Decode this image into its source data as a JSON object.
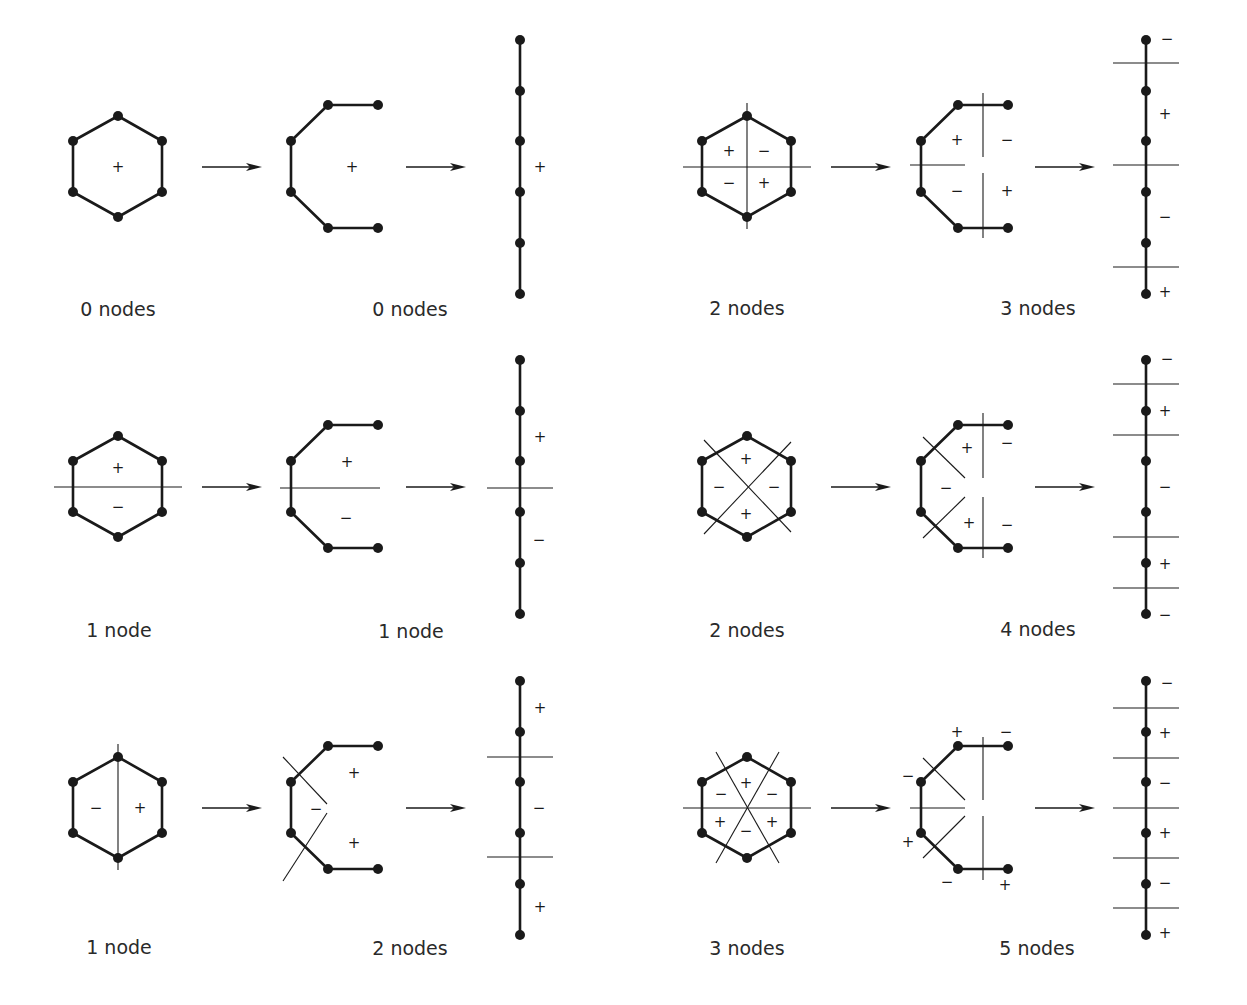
{
  "figure": {
    "colors": {
      "ink": "#1a1a1a",
      "background": "#ffffff"
    },
    "panels": [
      {
        "id": "r1-left",
        "col": 0,
        "row": 0,
        "hexagon": {
          "caption": "0 nodes",
          "node_lines": [],
          "signs": [
            {
              "s": "+",
              "dx": 0,
              "dy": 0
            }
          ]
        },
        "chain": {
          "node_lines": [],
          "signs": [
            {
              "s": "+",
              "x": 352,
              "y": 167
            }
          ]
        },
        "linear": {
          "caption": "0 nodes",
          "cuts": [],
          "signs": [
            {
              "s": "+",
              "x": 540,
              "y": 167
            }
          ]
        },
        "chain_caption": "0 nodes"
      },
      {
        "id": "r1-right",
        "col": 1,
        "row": 0,
        "hexagon": {
          "caption": "2 nodes",
          "node_lines": [
            "h",
            "v"
          ],
          "signs": [
            {
              "s": "+",
              "dx": -18,
              "dy": -16
            },
            {
              "s": "−",
              "dx": 17,
              "dy": -16
            },
            {
              "s": "−",
              "dx": -18,
              "dy": 16
            },
            {
              "s": "+",
              "dx": 17,
              "dy": 16
            }
          ]
        },
        "chain": {
          "lines": [
            [
              910,
              165,
              965,
              165
            ],
            [
              983,
              93,
              983,
              157
            ],
            [
              983,
              173,
              983,
              238
            ]
          ],
          "signs": [
            {
              "s": "+",
              "x": 957,
              "y": 140
            },
            {
              "s": "−",
              "x": 1007,
              "y": 140
            },
            {
              "s": "−",
              "x": 957,
              "y": 191
            },
            {
              "s": "+",
              "x": 1007,
              "y": 191
            }
          ]
        },
        "linear": {
          "cuts": [
            63,
            165,
            267
          ],
          "signs": [
            {
              "s": "−",
              "x": 1167,
              "y": 39
            },
            {
              "s": "+",
              "x": 1165,
              "y": 114
            },
            {
              "s": "−",
              "x": 1165,
              "y": 217
            },
            {
              "s": "+",
              "x": 1165,
              "y": 292
            }
          ]
        },
        "chain_caption": "3 nodes"
      },
      {
        "id": "r2-left",
        "col": 0,
        "row": 1,
        "hexagon": {
          "caption": "1 node",
          "node_lines": [
            "h"
          ],
          "signs": [
            {
              "s": "+",
              "dx": 0,
              "dy": -19
            },
            {
              "s": "−",
              "dx": 0,
              "dy": 20
            }
          ]
        },
        "chain": {
          "lines": [
            [
              280,
              488,
              380,
              488
            ]
          ],
          "signs": [
            {
              "s": "+",
              "x": 347,
              "y": 462
            },
            {
              "s": "−",
              "x": 346,
              "y": 518
            }
          ]
        },
        "linear": {
          "cuts": [
            488
          ],
          "signs": [
            {
              "s": "+",
              "x": 540,
              "y": 437
            },
            {
              "s": "−",
              "x": 539,
              "y": 540
            }
          ]
        },
        "chain_caption": "1 node"
      },
      {
        "id": "r2-right",
        "col": 1,
        "row": 1,
        "hexagon": {
          "caption": "2 nodes",
          "node_lines": [
            "d1",
            "d2"
          ],
          "signs": [
            {
              "s": "+",
              "dx": -1,
              "dy": -28
            },
            {
              "s": "−",
              "dx": -28,
              "dy": 0
            },
            {
              "s": "−",
              "dx": 27,
              "dy": 0
            },
            {
              "s": "+",
              "dx": -1,
              "dy": 27
            }
          ]
        },
        "chain": {
          "lines": [
            [
              923,
              437,
              965,
              478
            ],
            [
              923,
              538,
              965,
              497
            ],
            [
              983,
              413,
              983,
              478
            ],
            [
              983,
              497,
              983,
              558
            ]
          ],
          "signs": [
            {
              "s": "+",
              "x": 967,
              "y": 448
            },
            {
              "s": "−",
              "x": 1007,
              "y": 443
            },
            {
              "s": "−",
              "x": 946,
              "y": 488
            },
            {
              "s": "+",
              "x": 969,
              "y": 523
            },
            {
              "s": "−",
              "x": 1007,
              "y": 525
            }
          ]
        },
        "linear": {
          "cuts": [
            384,
            435,
            537,
            588
          ],
          "signs": [
            {
              "s": "−",
              "x": 1167,
              "y": 359
            },
            {
              "s": "+",
              "x": 1165,
              "y": 411
            },
            {
              "s": "−",
              "x": 1165,
              "y": 487
            },
            {
              "s": "+",
              "x": 1165,
              "y": 564
            },
            {
              "s": "−",
              "x": 1165,
              "y": 615
            }
          ]
        },
        "chain_caption": "4 nodes"
      },
      {
        "id": "r3-left",
        "col": 0,
        "row": 2,
        "hexagon": {
          "caption": "1 node",
          "node_lines": [
            "v"
          ],
          "signs": [
            {
              "s": "−",
              "dx": -22,
              "dy": 0
            },
            {
              "s": "+",
              "dx": 22,
              "dy": 0
            }
          ]
        },
        "chain": {
          "lines": [
            [
              283,
              757,
              327,
              804
            ],
            [
              283,
              881,
              327,
              813
            ]
          ],
          "signs": [
            {
              "s": "+",
              "x": 354,
              "y": 773
            },
            {
              "s": "−",
              "x": 316,
              "y": 809
            },
            {
              "s": "+",
              "x": 354,
              "y": 843
            }
          ]
        },
        "linear": {
          "cuts": [
            757,
            857
          ],
          "signs": [
            {
              "s": "+",
              "x": 540,
              "y": 708
            },
            {
              "s": "−",
              "x": 539,
              "y": 808
            },
            {
              "s": "+",
              "x": 540,
              "y": 907
            }
          ]
        },
        "chain_caption": "2 nodes"
      },
      {
        "id": "r3-right",
        "col": 1,
        "row": 2,
        "hexagon": {
          "caption": "3 nodes",
          "node_lines": [
            "h",
            "s1",
            "s2"
          ],
          "signs": [
            {
              "s": "+",
              "dx": -1,
              "dy": -25
            },
            {
              "s": "−",
              "dx": -26,
              "dy": -14
            },
            {
              "s": "−",
              "dx": 25,
              "dy": -14
            },
            {
              "s": "+",
              "dx": -27,
              "dy": 14
            },
            {
              "s": "−",
              "dx": -1,
              "dy": 23
            },
            {
              "s": "+",
              "dx": 25,
              "dy": 14
            }
          ]
        },
        "chain": {
          "lines": [
            [
              910,
              808,
              965,
              808
            ],
            [
              923,
              758,
              965,
              800
            ],
            [
              923,
              858,
              965,
              816
            ],
            [
              983,
              737,
              983,
              800
            ],
            [
              983,
              816,
              983,
              880
            ]
          ],
          "signs": [
            {
              "s": "+",
              "x": 957,
              "y": 732
            },
            {
              "s": "−",
              "x": 1006,
              "y": 732
            },
            {
              "s": "−",
              "x": 908,
              "y": 776
            },
            {
              "s": "+",
              "x": 908,
              "y": 842
            },
            {
              "s": "−",
              "x": 947,
              "y": 882
            },
            {
              "s": "+",
              "x": 1005,
              "y": 885
            }
          ]
        },
        "linear": {
          "cuts": [
            708,
            758,
            808,
            858,
            908
          ],
          "signs": [
            {
              "s": "−",
              "x": 1167,
              "y": 683
            },
            {
              "s": "+",
              "x": 1165,
              "y": 733
            },
            {
              "s": "−",
              "x": 1165,
              "y": 783
            },
            {
              "s": "+",
              "x": 1165,
              "y": 833
            },
            {
              "s": "−",
              "x": 1165,
              "y": 883
            },
            {
              "s": "+",
              "x": 1165,
              "y": 933
            }
          ]
        },
        "chain_caption": "5 nodes"
      }
    ]
  },
  "captions": {
    "r1_hex": "0 nodes",
    "r1_chain": "0 nodes",
    "r1r_hex": "2 nodes",
    "r1r_chain": "3 nodes",
    "r2_hex": "1 node",
    "r2_chain": "1 node",
    "r2r_hex": "2 nodes",
    "r2r_chain": "4 nodes",
    "r3_hex": "1 node",
    "r3_chain": "2 nodes",
    "r3r_hex": "3 nodes",
    "r3r_chain": "5 nodes"
  }
}
